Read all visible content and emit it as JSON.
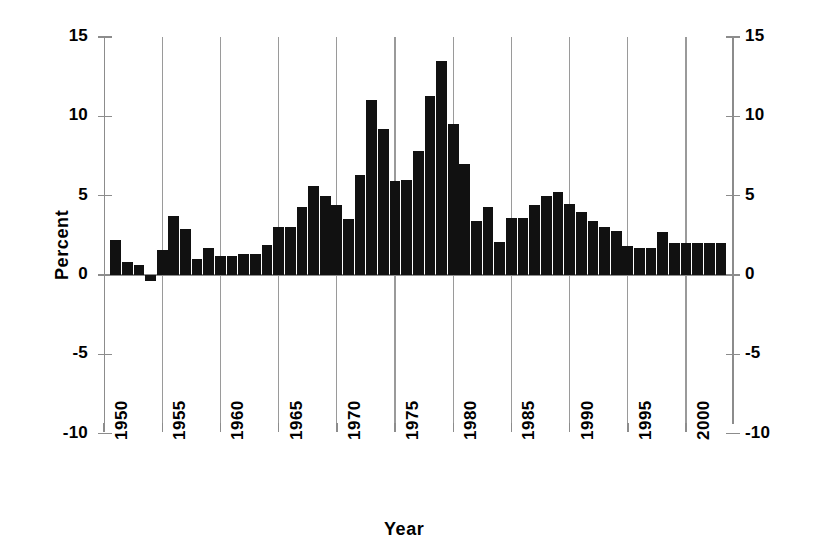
{
  "chart_data": {
    "type": "bar",
    "title": "",
    "xlabel": "Year",
    "ylabel": "Percent",
    "ylim": [
      -10,
      15
    ],
    "xlim": [
      1950.5,
      2003.5
    ],
    "grid": "vertical-only",
    "legend": "none",
    "y_ticks": [
      15,
      10,
      5,
      0,
      -5,
      -10
    ],
    "y_tick_labels": [
      "15",
      "10",
      "5",
      "0",
      "-5",
      "-10"
    ],
    "x_ticks": [
      1950,
      1955,
      1960,
      1965,
      1970,
      1975,
      1980,
      1985,
      1990,
      1995,
      2000
    ],
    "x_tick_labels": [
      "1950",
      "1955",
      "1960",
      "1965",
      "1970",
      "1975",
      "1980",
      "1985",
      "1990",
      "1995",
      "2000"
    ],
    "bar_color": "#111111",
    "axis_color": "#8c8c8c",
    "grid_color": "#9a9a9a",
    "categories": [
      1951,
      1952,
      1953,
      1954,
      1955,
      1956,
      1957,
      1958,
      1959,
      1960,
      1961,
      1962,
      1963,
      1964,
      1965,
      1966,
      1967,
      1968,
      1969,
      1970,
      1971,
      1972,
      1973,
      1974,
      1975,
      1976,
      1977,
      1978,
      1979,
      1980,
      1981,
      1982,
      1983,
      1984,
      1985,
      1986,
      1987,
      1988,
      1989,
      1990,
      1991,
      1992,
      1993,
      1994,
      1995,
      1996,
      1997,
      1998,
      1999,
      2000,
      2001,
      2002,
      2003
    ],
    "values": [
      2.2,
      0.8,
      0.6,
      -0.4,
      1.6,
      3.7,
      2.9,
      1.0,
      1.7,
      1.2,
      1.2,
      1.3,
      1.3,
      1.9,
      3.0,
      3.0,
      4.3,
      5.6,
      5.0,
      4.4,
      3.5,
      6.3,
      11.0,
      9.2,
      5.9,
      6.0,
      7.8,
      11.3,
      13.5,
      9.5,
      7.0,
      3.4,
      4.3,
      2.1,
      3.6,
      3.6,
      4.4,
      5.0,
      5.2,
      4.5,
      4.0,
      3.4,
      3.0,
      2.8,
      1.8,
      1.7,
      1.7,
      2.7,
      2.0,
      2.0,
      2.0,
      2.0,
      2.0
    ],
    "series": [
      {
        "name": "Percent",
        "values": [
          2.2,
          0.8,
          0.6,
          -0.4,
          1.6,
          3.7,
          2.9,
          1.0,
          1.7,
          1.2,
          1.2,
          1.3,
          1.3,
          1.9,
          3.0,
          3.0,
          4.3,
          5.6,
          5.0,
          4.4,
          3.5,
          6.3,
          11.0,
          9.2,
          5.9,
          6.0,
          7.8,
          11.3,
          13.5,
          9.5,
          7.0,
          3.4,
          4.3,
          2.1,
          3.6,
          3.6,
          4.4,
          5.0,
          5.2,
          4.5,
          4.0,
          3.4,
          3.0,
          2.8,
          1.8,
          1.7,
          1.7,
          2.7,
          2.0,
          2.0,
          2.0,
          2.0,
          2.0
        ]
      }
    ],
    "annotations": []
  }
}
